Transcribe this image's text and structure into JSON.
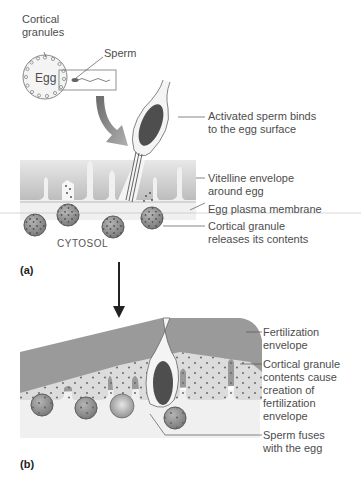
{
  "figure": {
    "panel_a": {
      "label": "(a)",
      "inset": {
        "cortical_granules_line1": "Cortical",
        "cortical_granules_line2": "granules",
        "egg": "Egg",
        "sperm": "Sperm"
      },
      "cytosol": "CYTOSOL",
      "callouts": [
        {
          "line1": "Activated sperm binds",
          "line2": "to the egg surface"
        },
        {
          "line1": "Vitelline envelope",
          "line2": "around egg"
        },
        {
          "line1": "Egg plasma membrane"
        },
        {
          "line1": "Cortical granule",
          "line2": "releases its contents"
        }
      ]
    },
    "panel_b": {
      "label": "(b)",
      "callouts": [
        {
          "line1": "Fertilization",
          "line2": "envelope"
        },
        {
          "line1": "Cortical granule",
          "line2": "contents cause",
          "line3": "creation of",
          "line4": "fertilization",
          "line5": "envelope"
        },
        {
          "line1": "Sperm fuses",
          "line2": "with the egg"
        }
      ]
    },
    "colors": {
      "envelope_gray": "#9a9a9a",
      "vitelline_light": "#d4d4d4",
      "cytosol": "#f0f0f0",
      "granule": "#8a8a8a",
      "nucleus": "#4e4e4e",
      "line": "#555555"
    }
  }
}
